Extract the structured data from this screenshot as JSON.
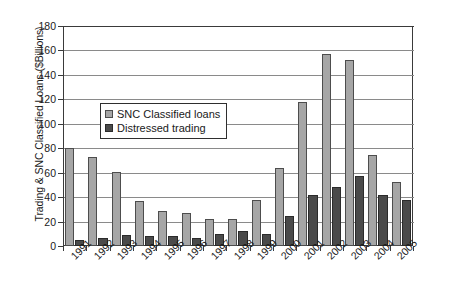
{
  "chart_data": {
    "type": "bar",
    "title": "",
    "subtitle": "",
    "xlabel": "",
    "ylabel": "Trading & SNC Classified Loans ($Billions)",
    "ylim": [
      0,
      180
    ],
    "ytick_step": 20,
    "yticks": [
      180,
      160,
      140,
      120,
      100,
      80,
      60,
      40,
      20,
      0
    ],
    "grid": "horizontal",
    "legend_position": "upper-left-inside",
    "categories": [
      "1991",
      "1992",
      "1993",
      "1994",
      "1995",
      "1996",
      "1997",
      "1998",
      "1999",
      "2000",
      "2001",
      "2002",
      "2003",
      "2004",
      "2005"
    ],
    "series": [
      {
        "name": "SNC Classified loans",
        "color": "#a6a6a6",
        "values": [
          80,
          72.5,
          60.5,
          36.5,
          28.5,
          27,
          22,
          22,
          37.5,
          63.5,
          118,
          157.5,
          152.5,
          74.5,
          52.5
        ]
      },
      {
        "name": "Distressed trading",
        "color": "#4a4a4a",
        "values": [
          5,
          6.5,
          9,
          8.5,
          8.5,
          6.5,
          9.5,
          12,
          9.5,
          24.5,
          42,
          48,
          57.5,
          42,
          37.5
        ]
      }
    ]
  },
  "legend": {
    "items": [
      {
        "label": "SNC Classified loans",
        "swatch": "snc"
      },
      {
        "label": "Distressed trading",
        "swatch": "distressed"
      }
    ]
  },
  "colors": {
    "snc": "#a6a6a6",
    "distressed": "#4a4a4a",
    "axis": "#3a3a3a",
    "gridline": "#8a8a8a",
    "background": "#ffffff"
  }
}
